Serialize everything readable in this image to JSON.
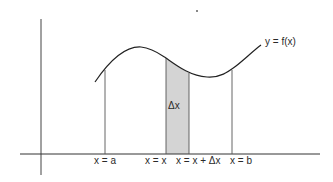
{
  "diagram": {
    "curve_label": "y = f(x)",
    "strip_label": "Δx",
    "x_labels": {
      "a": "x = a",
      "x": "x = x",
      "x_dx": "x = x + Δx",
      "b": "x = b"
    },
    "colors": {
      "line": "#333333",
      "strip_fill": "#d4d4d4",
      "background": "#ffffff"
    }
  }
}
